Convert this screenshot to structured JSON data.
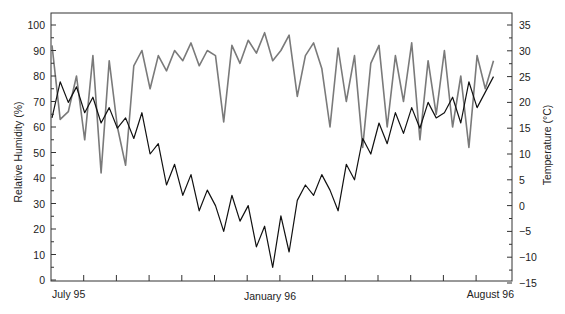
{
  "chart_data": {
    "type": "line",
    "title": "",
    "xlabel": "",
    "x_tick_labels": [
      "July 95",
      "January 96",
      "August 96"
    ],
    "x_months": [
      "Jul 95",
      "Aug 95",
      "Sep 95",
      "Oct 95",
      "Nov 95",
      "Dec 95",
      "Jan 96",
      "Feb 96",
      "Mar 96",
      "Apr 96",
      "May 96",
      "Jun 96",
      "Jul 96",
      "Aug 96"
    ],
    "y_left": {
      "label": "Relative Humidity (%)",
      "ticks": [
        0,
        10,
        20,
        30,
        40,
        50,
        60,
        70,
        80,
        90,
        100
      ],
      "range": [
        0,
        105
      ]
    },
    "y_right": {
      "label": "Temperature (°C)",
      "ticks": [
        -15,
        -10,
        -5,
        0,
        5,
        10,
        15,
        20,
        25,
        30,
        35
      ],
      "range": [
        -15,
        35
      ]
    },
    "grid": false,
    "legend": null,
    "series": [
      {
        "name": "Relative Humidity",
        "axis": "left",
        "color": "#7a7a7a",
        "x_month_offset": [
          0,
          0.25,
          0.5,
          0.75,
          1,
          1.25,
          1.5,
          1.75,
          2,
          2.25,
          2.5,
          2.75,
          3,
          3.25,
          3.5,
          3.75,
          4,
          4.25,
          4.5,
          4.75,
          5,
          5.25,
          5.5,
          5.75,
          6,
          6.25,
          6.5,
          6.75,
          7,
          7.25,
          7.5,
          7.75,
          8,
          8.25,
          8.5,
          8.75,
          9,
          9.25,
          9.5,
          9.75,
          10,
          10.25,
          10.5,
          10.75,
          11,
          11.25,
          11.5,
          11.75,
          12,
          12.25,
          12.5,
          12.75,
          13,
          13.25,
          13.5
        ],
        "values": [
          92,
          63,
          66,
          80,
          55,
          88,
          42,
          86,
          60,
          45,
          84,
          90,
          75,
          88,
          82,
          90,
          86,
          93,
          84,
          90,
          88,
          62,
          92,
          85,
          94,
          89,
          97,
          86,
          90,
          96,
          72,
          88,
          93,
          83,
          60,
          91,
          70,
          88,
          52,
          85,
          92,
          60,
          88,
          70,
          93,
          55,
          86,
          65,
          90,
          60,
          80,
          52,
          88,
          75,
          86
        ]
      },
      {
        "name": "Temperature",
        "axis": "right",
        "color": "#111111",
        "x_month_offset": [
          0,
          0.25,
          0.5,
          0.75,
          1,
          1.25,
          1.5,
          1.75,
          2,
          2.25,
          2.5,
          2.75,
          3,
          3.25,
          3.5,
          3.75,
          4,
          4.25,
          4.5,
          4.75,
          5,
          5.25,
          5.5,
          5.75,
          6,
          6.25,
          6.5,
          6.75,
          7,
          7.25,
          7.5,
          7.75,
          8,
          8.25,
          8.5,
          8.75,
          9,
          9.25,
          9.5,
          9.75,
          10,
          10.25,
          10.5,
          10.75,
          11,
          11.25,
          11.5,
          11.75,
          12,
          12.25,
          12.5,
          12.75,
          13,
          13.25,
          13.5
        ],
        "values": [
          17,
          24,
          20,
          23,
          18,
          21,
          16,
          19,
          15,
          17,
          13,
          18,
          10,
          12,
          4,
          8,
          2,
          6,
          -1,
          3,
          0,
          -5,
          2,
          -3,
          0,
          -8,
          -4,
          -12,
          -2,
          -9,
          1,
          4,
          2,
          6,
          3,
          -1,
          8,
          5,
          13,
          10,
          16,
          12,
          18,
          14,
          19,
          15,
          20,
          17,
          18,
          21,
          16,
          24,
          19,
          22,
          25
        ]
      }
    ]
  },
  "axes": {
    "left_label": "Relative Humidity (%)",
    "right_label": "Temperature (°C)",
    "left_ticks": [
      "100",
      "90",
      "80",
      "70",
      "60",
      "50",
      "40",
      "30",
      "20",
      "10",
      "0"
    ],
    "right_ticks": [
      "35",
      "30",
      "25",
      "20",
      "15",
      "10",
      "5",
      "0",
      "−5",
      "−10",
      "−15"
    ],
    "x_labels": {
      "start": "July 95",
      "mid": "January 96",
      "end": "August 96"
    }
  }
}
